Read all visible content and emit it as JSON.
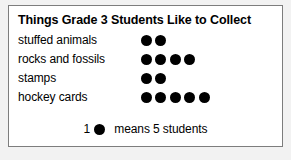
{
  "chart_data": {
    "type": "bar",
    "subtype": "pictograph",
    "title": "Things Grade 3 Students Like to Collect",
    "xlabel": "",
    "ylabel": "",
    "categories": [
      "stuffed animals",
      "rocks and fossils",
      "stamps",
      "hockey cards"
    ],
    "symbol_counts": [
      2,
      4,
      2,
      5
    ],
    "values": [
      10,
      20,
      10,
      25
    ],
    "symbol_unit_value": 5,
    "symbol_icon": "filled-circle-icon",
    "symbol_color": "#000000",
    "grid": false,
    "legend": {
      "position": "bottom-center",
      "count_label": "1",
      "text": "means 5 students",
      "symbol_icon": "filled-circle-icon"
    },
    "annotations": []
  },
  "card": {
    "border_color": "#7d7d7d",
    "background_color": "#ffffff",
    "page_background_color": "#f2f2f2"
  },
  "rows": [
    {
      "label": "stuffed animals",
      "dots": [
        1,
        2
      ]
    },
    {
      "label": "rocks and fossils",
      "dots": [
        1,
        2,
        3,
        4
      ]
    },
    {
      "label": "stamps",
      "dots": [
        1,
        2
      ]
    },
    {
      "label": "hockey cards",
      "dots": [
        1,
        2,
        3,
        4,
        5
      ]
    }
  ]
}
